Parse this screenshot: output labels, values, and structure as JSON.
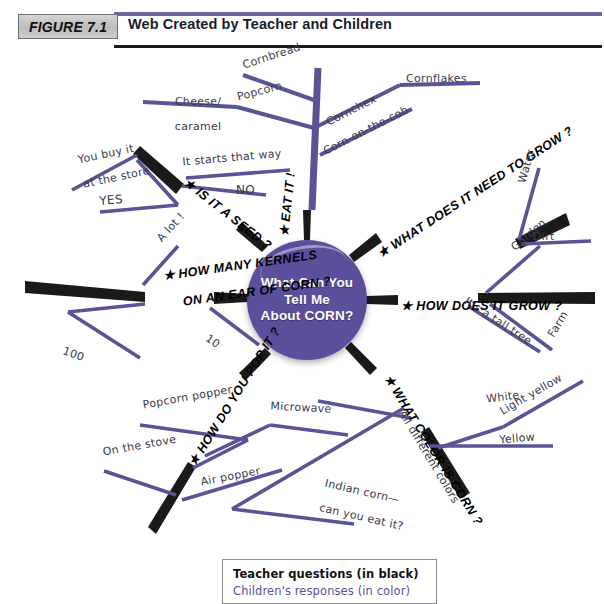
{
  "header": {
    "figure_badge": "FIGURE 7.1",
    "title": "Web Created by Teacher and Children"
  },
  "center": {
    "text": "What Can You Tell Me About CORN?",
    "line1": "What Can You",
    "line2": "Tell Me",
    "line3": "About CORN?",
    "color": "#5b4f9c"
  },
  "legend": {
    "teacher": "Teacher questions (in black)",
    "children": "Children's responses (in color)",
    "teacher_color": "#111111",
    "children_color": "#5a5394"
  },
  "colors": {
    "teacher_line": "#1a1a1a",
    "child_line": "#5a5394",
    "bubble": "#5b4f9c",
    "header_rule_purple": "#6b6aa0",
    "header_rule_black": "#1a1a1a",
    "badge_fill": "#c9c9c9"
  },
  "questions": [
    {
      "id": "eat-it",
      "label": "EAT IT !"
    },
    {
      "id": "is-it-a-seed",
      "label": "IS IT A SEED ?"
    },
    {
      "id": "how-many-kernels",
      "label": "HOW MANY KERNELS ON AN EAR OF CORN ?",
      "line1": "HOW MANY KERNELS",
      "line2": "ON AN EAR OF CORN ?"
    },
    {
      "id": "how-do-you-pop-it",
      "label": "HOW DO YOU POP IT ?"
    },
    {
      "id": "what-color-is-corn",
      "label": "WHAT COLOR IS CORN ?"
    },
    {
      "id": "how-does-it-grow",
      "label": "HOW DOES IT GROW ?"
    },
    {
      "id": "what-need-to-grow",
      "label": "WHAT DOES IT NEED TO GROW ?"
    }
  ],
  "responses": {
    "eat_it": [
      "Cheese/ caramel",
      "Cornbread",
      "Popcorn",
      "Cornchex",
      "Cornflakes",
      "Corn-on-the-cob"
    ],
    "is_it_a_seed": [
      "It starts that way",
      "You buy it at the store",
      "NO",
      "YES"
    ],
    "how_many_kernels": [
      "A lot !",
      "10",
      "100"
    ],
    "how_do_you_pop_it": [
      "Popcorn popper",
      "Microwave",
      "On the stove",
      "Air popper"
    ],
    "what_color_is_corn": [
      "White",
      "Light yellow",
      "Yellow",
      "All different colors",
      "Indian corn— can you eat it?"
    ],
    "how_does_it_grow": [
      "Garden",
      "Farm",
      "It's a tall tree"
    ],
    "what_need_to_grow": [
      "Water",
      "Dirt"
    ]
  },
  "labels": {
    "cheese_caramel_1": "Cheese/",
    "cheese_caramel_2": "caramel",
    "cornbread": "Cornbread",
    "popcorn": "Popcorn",
    "cornchex": "Cornchex",
    "cornflakes": "Cornflakes",
    "corn_on_the_cob": "Corn-on-the-cob",
    "it_starts_that_way": "It starts that way",
    "you_buy_it_1": "You buy it",
    "you_buy_it_2": "at the store",
    "no": "NO",
    "yes": "YES",
    "a_lot": "A lot !",
    "ten": "10",
    "hundred": "100",
    "popcorn_popper": "Popcorn popper",
    "microwave": "Microwave",
    "on_the_stove": "On the stove",
    "air_popper": "Air popper",
    "white": "White",
    "light_yellow": "Light yellow",
    "yellow": "Yellow",
    "all_different_colors": "All different colors",
    "indian_corn_1": "Indian corn—",
    "indian_corn_2": "can you eat it?",
    "garden": "Garden",
    "farm": "Farm",
    "its_a_tall_tree": "It's a tall tree",
    "water": "Water",
    "dirt": "Dirt",
    "q_eat_it": "★ EAT IT !",
    "q_is_it_a_seed": "★ IS IT A SEED ?",
    "q_kernels_1": "★ HOW MANY KERNELS",
    "q_kernels_2": "ON AN EAR OF CORN ?",
    "q_pop_it": "★ HOW DO YOU POP IT ?",
    "q_what_color": "★ WHAT COLOR IS CORN ?",
    "q_how_grow": "★ HOW DOES IT GROW ?",
    "q_need_grow": "★ WHAT DOES IT NEED TO GROW ?"
  }
}
